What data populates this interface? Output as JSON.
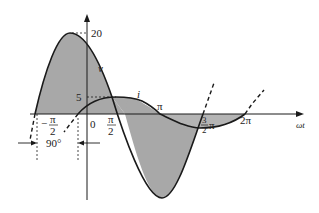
{
  "diagram": {
    "title": "",
    "axis": {
      "x_label": "ωt",
      "y_ticks": [
        {
          "label": "20",
          "value": 20
        },
        {
          "label": "5",
          "value": 5
        }
      ]
    },
    "x_ticks": {
      "neg_half_pi_minus": "−",
      "neg_half_pi_num": "π",
      "neg_half_pi_den": "2",
      "zero": "0",
      "half_pi_num": "π",
      "half_pi_den": "2",
      "pi": "π",
      "three_half_pi_num": "3",
      "three_half_pi_den": "2",
      "three_half_pi_pi": "π",
      "two_pi": "2π"
    },
    "curves": {
      "v_label": "v",
      "i_label": "i"
    },
    "phase": {
      "label": "90°"
    },
    "colors": {
      "shade": "#a9a9a9",
      "stroke": "#1a1a1a",
      "background": "#ffffff"
    }
  }
}
